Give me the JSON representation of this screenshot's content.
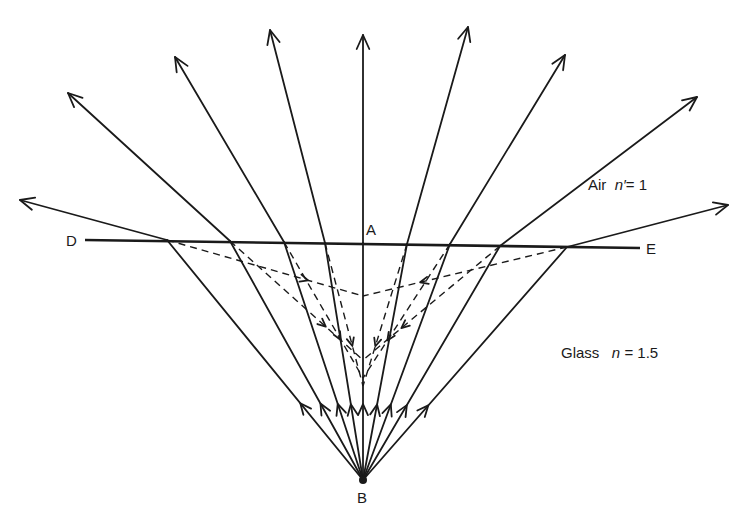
{
  "figure": {
    "colors": {
      "ink": "#1a1a1a",
      "background": "#ffffff"
    }
  },
  "labels": {
    "point_d": "D",
    "point_e": "E",
    "point_a": "A",
    "point_b": "B",
    "air_medium": "Air",
    "air_index_symbol": "n′",
    "air_index_value": "= 1",
    "glass_medium": "Glass",
    "glass_index_symbol": "n",
    "glass_index_value": "= 1.5"
  },
  "geometry": {
    "source_point_b": [
      363,
      480
    ],
    "interface_start_d": [
      85,
      240
    ],
    "interface_end_e": [
      640,
      248
    ],
    "rays": [
      {
        "hit": [
          167,
          240
        ],
        "tip": [
          20,
          200
        ],
        "virtual": [
          363,
          296
        ]
      },
      {
        "hit": [
          230,
          241
        ],
        "tip": [
          68,
          93
        ],
        "virtual": [
          363,
          360
        ]
      },
      {
        "hit": [
          284,
          242
        ],
        "tip": [
          175,
          57
        ],
        "virtual": [
          363,
          378
        ]
      },
      {
        "hit": [
          325,
          243
        ],
        "tip": [
          270,
          30
        ],
        "virtual": [
          363,
          386
        ]
      },
      {
        "hit": [
          363,
          243
        ],
        "tip": [
          363,
          35
        ],
        "virtual": null
      },
      {
        "hit": [
          407,
          244
        ],
        "tip": [
          468,
          27
        ],
        "virtual": [
          363,
          386
        ]
      },
      {
        "hit": [
          450,
          244
        ],
        "tip": [
          565,
          55
        ],
        "virtual": [
          363,
          378
        ]
      },
      {
        "hit": [
          500,
          246
        ],
        "tip": [
          697,
          97
        ],
        "virtual": [
          363,
          360
        ]
      },
      {
        "hit": [
          567,
          247
        ],
        "tip": [
          728,
          205
        ],
        "virtual": [
          363,
          296
        ]
      }
    ]
  }
}
